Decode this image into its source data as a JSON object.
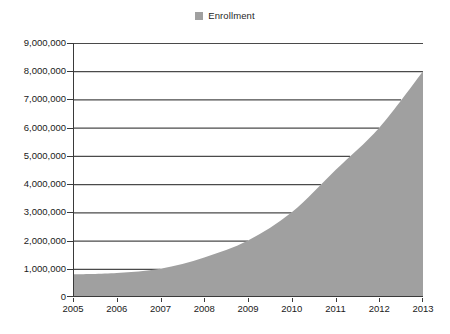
{
  "legend": {
    "position": "top-center",
    "entries": [
      {
        "label": "Enrollment",
        "swatch_name": "legend-swatch-enrollment",
        "color": "#a0a0a0"
      }
    ]
  },
  "colors": {
    "area_fill": "#a0a0a0",
    "gridline": "#4a4a4a",
    "axis_line": "#3a3a3a",
    "plot_background": "#ffffff",
    "text": "#1a1a1a"
  },
  "chart_data": {
    "type": "area",
    "title": "",
    "subtitle": "",
    "xlabel": "",
    "ylabel": "",
    "x": [
      2005,
      2006,
      2007,
      2008,
      2009,
      2010,
      2011,
      2012,
      2013
    ],
    "categories": [
      "2005",
      "2006",
      "2007",
      "2008",
      "2009",
      "2010",
      "2011",
      "2012",
      "2013"
    ],
    "series": [
      {
        "name": "Enrollment",
        "color": "#a0a0a0",
        "values": [
          800000,
          850000,
          1000000,
          1400000,
          2000000,
          3000000,
          4500000,
          6000000,
          8000000
        ]
      }
    ],
    "xlim": [
      2005,
      2013
    ],
    "ylim": [
      0,
      9000000
    ],
    "ytick_values": [
      0,
      1000000,
      2000000,
      3000000,
      4000000,
      5000000,
      6000000,
      7000000,
      8000000,
      9000000
    ],
    "ytick_labels": [
      "0",
      "1,000,000",
      "2,000,000",
      "3,000,000",
      "4,000,000",
      "5,000,000",
      "6,000,000",
      "7,000,000",
      "8,000,000",
      "9,000,000"
    ],
    "xtick_labels": [
      "2005",
      "2006",
      "2007",
      "2008",
      "2009",
      "2010",
      "2011",
      "2012",
      "2013"
    ],
    "grid": true,
    "grid_axis": "y",
    "legend": "top-center"
  }
}
